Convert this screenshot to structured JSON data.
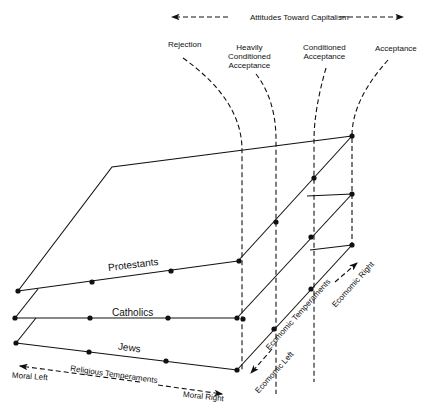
{
  "title": "Attitudes Toward Capitalism",
  "categories": {
    "rejection": "Rejection",
    "heavily": [
      "Heavily",
      "Conditioned",
      "Acceptance"
    ],
    "conditioned": [
      "Conditioned",
      "Acceptance"
    ],
    "acceptance": "Acceptance"
  },
  "planes": {
    "protestants": "Protestants",
    "catholics": "Catholics",
    "jews": "Jews"
  },
  "religious_axis": {
    "label": "Religious Temperaments",
    "left": "Moral Left",
    "right": "Moral Right"
  },
  "economic_axis": {
    "label": "Ecomomic Temperaments",
    "left": "Ecomomic Left",
    "right": "Ecomomic Right"
  },
  "colors": {
    "line": "#111111",
    "background": "#ffffff"
  }
}
